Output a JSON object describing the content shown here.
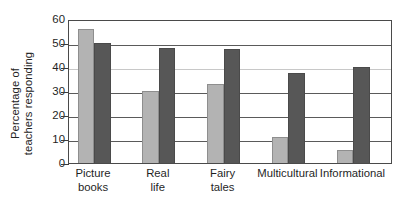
{
  "chart_data": {
    "type": "bar",
    "title": "",
    "subtitle": "",
    "xlabel": "",
    "ylabel": "Percentage of teachers responding",
    "ylabel_lines": [
      "Percentage of",
      "teachers responding"
    ],
    "categories": [
      "Picture books",
      "Real life",
      "Fairy tales",
      "Multicultural",
      "Informational"
    ],
    "category_lines": [
      [
        "Picture",
        "books"
      ],
      [
        "Real",
        "life"
      ],
      [
        "Fairy",
        "tales"
      ],
      [
        "Multicultural"
      ],
      [
        "Informational"
      ]
    ],
    "series": [
      {
        "name": "light-gray-series",
        "color": "#b3b3b3",
        "values": [
          56,
          30,
          33,
          11,
          5.5
        ]
      },
      {
        "name": "dark-gray-series",
        "color": "#575757",
        "values": [
          50,
          48,
          47.5,
          37.5,
          40
        ]
      }
    ],
    "ylim": [
      0,
      60
    ],
    "ytick_values": [
      0,
      10,
      20,
      30,
      40,
      50,
      60
    ],
    "ytick_labels": [
      "0",
      "10",
      "20",
      "30",
      "40",
      "50",
      "60"
    ],
    "grid": true,
    "grid_axis": "y",
    "legend": "none",
    "legend_position": "none",
    "frame": true,
    "annotations": []
  },
  "colors": {
    "background": "#ffffff",
    "axis": "#4a4a4a",
    "grid": "#5a5a5a",
    "text": "#1f1f1f",
    "series_light": "#b3b3b3",
    "series_dark": "#575757"
  }
}
